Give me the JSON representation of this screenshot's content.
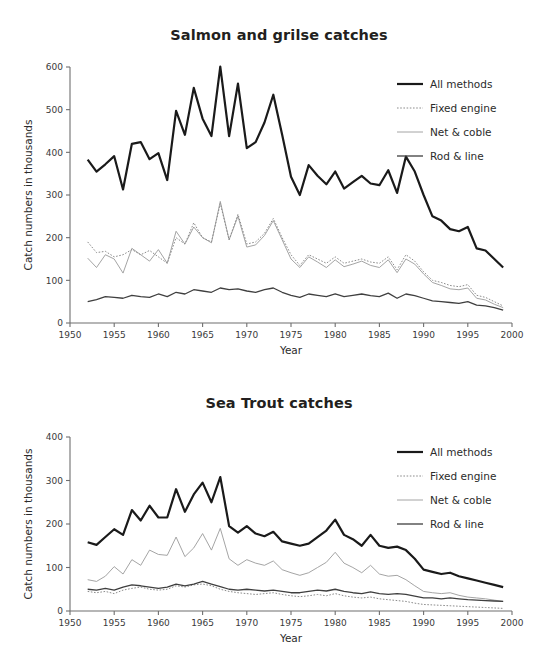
{
  "page": {
    "background": "#ffffff",
    "text_color": "#2b2b2b"
  },
  "legend": {
    "entries": [
      {
        "label": "All methods",
        "style": "thick-solid",
        "color": "#1a1a1a"
      },
      {
        "label": "Fixed engine",
        "style": "dotted",
        "color": "#8c8c8c"
      },
      {
        "label": "Net & coble",
        "style": "thin-solid",
        "color": "#9a9a9a"
      },
      {
        "label": "Rod & line",
        "style": "medium-solid",
        "color": "#3f3f3f"
      }
    ]
  },
  "charts": {
    "salmon": {
      "title": "Salmon and grilse catches",
      "xlabel": "Year",
      "ylabel": "Catch numbers in thousands"
    },
    "seatrout": {
      "title": "Sea Trout catches",
      "xlabel": "Year",
      "ylabel": "Catch numbers in thousands"
    }
  },
  "chart_data": [
    {
      "id": "salmon",
      "type": "line",
      "title": "Salmon and grilse catches",
      "subtitle": "",
      "xlabel": "Year",
      "ylabel": "Catch numbers in thousands",
      "xlim": [
        1950,
        2000
      ],
      "ylim": [
        0,
        600
      ],
      "xticks": [
        1950,
        1955,
        1960,
        1965,
        1970,
        1975,
        1980,
        1985,
        1990,
        1995,
        2000
      ],
      "yticks": [
        0,
        100,
        200,
        300,
        400,
        500,
        600
      ],
      "grid": false,
      "legend_position": "top-right",
      "x": [
        1952,
        1953,
        1954,
        1955,
        1956,
        1957,
        1958,
        1959,
        1960,
        1961,
        1962,
        1963,
        1964,
        1965,
        1966,
        1967,
        1968,
        1969,
        1970,
        1971,
        1972,
        1973,
        1974,
        1975,
        1976,
        1977,
        1978,
        1979,
        1980,
        1981,
        1982,
        1983,
        1984,
        1985,
        1986,
        1987,
        1988,
        1989,
        1990,
        1991,
        1992,
        1993,
        1994,
        1995,
        1996,
        1997,
        1998,
        1999
      ],
      "series": [
        {
          "name": "All methods",
          "style": "thick-solid",
          "color": "#1a1a1a",
          "values": [
            383,
            355,
            372,
            391,
            313,
            420,
            424,
            384,
            398,
            335,
            497,
            441,
            551,
            479,
            438,
            601,
            438,
            561,
            410,
            424,
            470,
            535,
            441,
            343,
            300,
            370,
            345,
            325,
            355,
            315,
            330,
            345,
            327,
            323,
            358,
            305,
            390,
            355,
            300,
            250,
            240,
            220,
            215,
            225,
            175,
            170,
            150,
            130,
            120,
            105,
            95,
            80,
            75,
            55,
            50
          ]
        },
        {
          "name": "Fixed engine",
          "style": "dotted",
          "color": "#8c8c8c",
          "values": [
            190,
            165,
            168,
            155,
            160,
            172,
            160,
            170,
            155,
            140,
            200,
            185,
            235,
            200,
            190,
            280,
            195,
            255,
            185,
            190,
            210,
            245,
            200,
            160,
            135,
            160,
            150,
            140,
            155,
            140,
            145,
            150,
            143,
            140,
            155,
            125,
            160,
            145,
            120,
            100,
            95,
            88,
            85,
            90,
            65,
            60,
            50,
            40,
            33,
            25,
            20,
            14,
            10,
            5,
            2
          ]
        },
        {
          "name": "Net & coble",
          "style": "thin-solid",
          "color": "#9a9a9a",
          "values": [
            152,
            130,
            160,
            150,
            117,
            175,
            160,
            145,
            172,
            140,
            215,
            185,
            225,
            200,
            188,
            285,
            195,
            250,
            178,
            183,
            205,
            240,
            195,
            150,
            130,
            155,
            143,
            130,
            148,
            132,
            138,
            145,
            135,
            130,
            148,
            118,
            150,
            138,
            115,
            95,
            88,
            80,
            78,
            82,
            58,
            54,
            44,
            36,
            28,
            22,
            17,
            12,
            8,
            4,
            2
          ]
        },
        {
          "name": "Rod & line",
          "style": "medium-solid",
          "color": "#3f3f3f",
          "values": [
            50,
            55,
            62,
            60,
            58,
            65,
            62,
            60,
            68,
            62,
            72,
            68,
            78,
            75,
            72,
            82,
            78,
            80,
            75,
            72,
            78,
            82,
            72,
            65,
            60,
            68,
            65,
            62,
            68,
            62,
            65,
            68,
            64,
            62,
            70,
            58,
            68,
            64,
            58,
            52,
            50,
            48,
            46,
            50,
            42,
            40,
            36,
            30,
            26,
            22,
            18,
            14,
            10,
            6,
            3
          ]
        }
      ]
    },
    {
      "id": "seatrout",
      "type": "line",
      "title": "Sea Trout catches",
      "subtitle": "",
      "xlabel": "Year",
      "ylabel": "Catch numbers in thousands",
      "xlim": [
        1950,
        2000
      ],
      "ylim": [
        0,
        400
      ],
      "xticks": [
        1950,
        1955,
        1960,
        1965,
        1970,
        1975,
        1980,
        1985,
        1990,
        1995,
        2000
      ],
      "yticks": [
        0,
        100,
        200,
        300,
        400
      ],
      "grid": false,
      "legend_position": "top-right",
      "x": [
        1952,
        1953,
        1954,
        1955,
        1956,
        1957,
        1958,
        1959,
        1960,
        1961,
        1962,
        1963,
        1964,
        1965,
        1966,
        1967,
        1968,
        1969,
        1970,
        1971,
        1972,
        1973,
        1974,
        1975,
        1976,
        1977,
        1978,
        1979,
        1980,
        1981,
        1982,
        1983,
        1984,
        1985,
        1986,
        1987,
        1988,
        1989,
        1990,
        1991,
        1992,
        1993,
        1994,
        1995,
        1996,
        1997,
        1998,
        1999
      ],
      "series": [
        {
          "name": "All methods",
          "style": "thick-solid",
          "color": "#1a1a1a",
          "values": [
            158,
            152,
            170,
            188,
            175,
            232,
            208,
            242,
            215,
            215,
            280,
            228,
            268,
            295,
            250,
            308,
            195,
            180,
            195,
            178,
            172,
            182,
            160,
            155,
            150,
            155,
            170,
            185,
            210,
            175,
            165,
            150,
            175,
            150,
            145,
            148,
            140,
            120,
            95,
            90,
            85,
            88,
            80,
            75,
            70,
            65,
            60,
            55,
            48,
            45,
            42,
            40,
            38,
            36,
            35
          ]
        },
        {
          "name": "Fixed engine",
          "style": "dotted",
          "color": "#8c8c8c",
          "values": [
            45,
            42,
            45,
            40,
            48,
            52,
            55,
            50,
            48,
            50,
            58,
            55,
            60,
            62,
            58,
            50,
            45,
            42,
            40,
            38,
            40,
            42,
            38,
            35,
            33,
            35,
            38,
            35,
            40,
            35,
            32,
            30,
            32,
            28,
            26,
            24,
            22,
            18,
            15,
            14,
            13,
            12,
            11,
            10,
            9,
            8,
            7,
            6,
            5,
            5,
            4,
            4,
            3,
            3,
            3
          ]
        },
        {
          "name": "Net & coble",
          "style": "thin-solid",
          "color": "#9a9a9a",
          "values": [
            72,
            68,
            80,
            102,
            85,
            118,
            105,
            140,
            130,
            128,
            170,
            125,
            145,
            178,
            140,
            190,
            120,
            105,
            118,
            110,
            105,
            115,
            95,
            88,
            82,
            88,
            100,
            112,
            135,
            110,
            100,
            88,
            105,
            85,
            80,
            82,
            72,
            58,
            45,
            42,
            40,
            42,
            36,
            32,
            30,
            28,
            25,
            22,
            18,
            16,
            14,
            12,
            10,
            9,
            8
          ]
        },
        {
          "name": "Rod & line",
          "style": "medium-solid",
          "color": "#3f3f3f",
          "values": [
            50,
            48,
            52,
            48,
            55,
            60,
            58,
            55,
            52,
            55,
            62,
            58,
            62,
            68,
            62,
            56,
            50,
            48,
            50,
            48,
            46,
            48,
            45,
            42,
            42,
            45,
            48,
            46,
            50,
            45,
            42,
            40,
            44,
            40,
            38,
            40,
            38,
            34,
            30,
            30,
            28,
            30,
            28,
            26,
            25,
            24,
            23,
            22,
            20,
            19,
            18,
            17,
            16,
            15,
            14
          ]
        }
      ]
    }
  ]
}
